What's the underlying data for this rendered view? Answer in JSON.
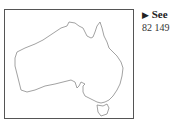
{
  "map": {
    "region": "Australia",
    "outline_color": "#888888",
    "frame_color": "#555555"
  },
  "link": {
    "arrow": "▶",
    "label": "See",
    "code": "82 149"
  }
}
